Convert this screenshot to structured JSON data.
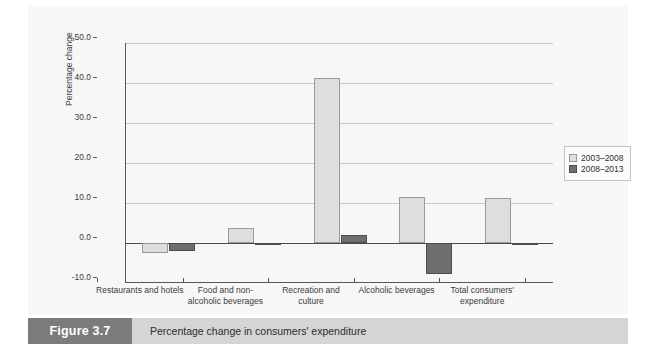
{
  "figure": {
    "tag": "Figure 3.7",
    "caption": "Percentage change in consumers' expenditure"
  },
  "chart_data": {
    "type": "bar",
    "title": "Percentage change in consumers' expenditure",
    "xlabel": "",
    "ylabel": "Percentage change",
    "ylim": [
      -10.0,
      50.0
    ],
    "ytick_labels": [
      "50.0",
      "40.0",
      "30.0",
      "20.0",
      "10.0",
      "0.0",
      "-10.0"
    ],
    "ytick_values": [
      50.0,
      40.0,
      30.0,
      20.0,
      10.0,
      0.0,
      -10.0
    ],
    "grid": true,
    "legend_position": "right",
    "categories": [
      "Restaurants and hotels",
      "Food and non-alcoholic beverages",
      "Recreation and culture",
      "Alcoholic beverages",
      "Total consumers' expenditure"
    ],
    "category_labels": [
      "Restaurants and hotels",
      "Food and non-\nalcoholic beverages",
      "Recreation and\nculture",
      "Alcoholic beverages",
      "Total consumers'\nexpenditure"
    ],
    "series": [
      {
        "name": "2003–2008",
        "color": "#dedede",
        "values": [
          -2.6,
          3.7,
          41.2,
          11.5,
          11.3
        ]
      },
      {
        "name": "2008–2013",
        "color": "#6e6e6e",
        "values": [
          -1.9,
          -0.3,
          2.0,
          -7.7,
          -0.4
        ]
      }
    ]
  },
  "legend": {
    "items": [
      {
        "label": "2003–2008",
        "color": "#dedede"
      },
      {
        "label": "2008–2013",
        "color": "#6e6e6e"
      }
    ]
  }
}
